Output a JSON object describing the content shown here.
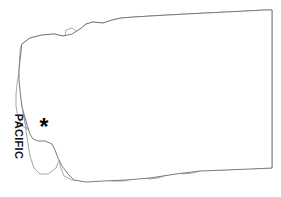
{
  "figure": {
    "subject_state": "Washington",
    "background_color": "#ffffff",
    "county_line_color": "#8a8a8a",
    "state_outline_color": "#6e6e6e",
    "marker_color": "#000000"
  },
  "labels": {
    "ocean_label": "PACIFIC",
    "ocean_label_orientation": "vertical-rotated-90",
    "marker_glyph": "*",
    "marker_name": "asterisk-marker",
    "marker_meaning": "highlighted county location"
  },
  "geometry": {
    "state_outline": "M 22 44 L 30 38 L 42 35 L 54 34 L 63 36 L 72 34 L 80 29 L 86 24 L 93 22 L 103 23 L 112 20 L 121 18 L 134 17 L 150 16 L 168 15 L 186 14 L 206 13 L 226 12 L 246 11 L 264 10 L 272 10 L 272 30 L 272 60 L 272 90 L 272 120 L 272 150 L 272 168 L 250 169 L 226 170 L 200 171 L 176 174 L 150 178 L 126 180 L 104 181 L 86 182 L 74 180 L 68 174 L 62 166 L 58 158 L 55 150 L 52 144 L 45 141 L 38 141 L 33 139 L 30 134 L 28 128 L 26 121 L 24 114 L 22 107 L 21 99 L 20 90 L 19 80 L 19 70 L 20 60 L 21 52 Z",
    "counties": [
      "M 22 44 L 30 38 L 42 35 L 54 34 L 63 36 L 72 34 L 80 29 L 86 24 L 93 22 L 96 30 L 93 40 L 88 48 L 80 54 L 70 58 L 58 60 L 44 61 L 32 61 L 24 60 L 20 56 L 20 50 Z",
      "M 93 22 L 103 23 L 112 20 L 121 18 L 134 17 L 150 16 L 150 26 L 148 36 L 144 46 L 136 50 L 124 52 L 112 53 L 100 54 L 90 54 L 88 48 L 93 40 L 96 30 Z",
      "M 150 16 L 168 15 L 186 14 L 206 13 L 208 30 L 208 48 L 206 62 L 198 66 L 186 66 L 174 62 L 164 56 L 156 50 L 150 44 L 148 36 Z",
      "M 206 13 L 226 12 L 246 11 L 248 30 L 248 48 L 246 62 L 240 68 L 228 70 L 216 68 L 208 64 L 206 62 L 208 48 L 208 30 Z",
      "M 246 11 L 264 10 L 272 10 L 272 30 L 272 56 L 272 74 L 260 74 L 250 72 L 246 68 L 246 62 L 248 48 L 248 30 Z",
      "M 20 56 L 32 61 L 44 61 L 58 60 L 70 58 L 80 54 L 82 66 L 82 78 L 80 88 L 72 92 L 58 94 L 44 94 L 30 94 L 22 92 L 20 86 L 19 74 Z",
      "M 80 54 L 90 54 L 100 54 L 112 53 L 124 52 L 126 66 L 126 80 L 124 92 L 116 96 L 104 98 L 92 98 L 84 96 L 80 88 L 82 78 L 82 66 Z",
      "M 124 52 L 136 50 L 144 46 L 148 36 L 150 44 L 156 50 L 164 56 L 166 70 L 164 84 L 158 94 L 148 98 L 136 98 L 128 96 L 124 92 L 126 80 L 126 66 Z",
      "M 166 70 L 174 62 L 186 66 L 198 66 L 206 62 L 208 64 L 206 76 L 200 86 L 192 94 L 182 98 L 172 100 L 164 98 L 158 94 L 164 84 Z",
      "M 206 62 L 216 68 L 228 70 L 240 68 L 246 68 L 250 72 L 250 86 L 248 100 L 240 104 L 226 106 L 212 106 L 204 102 L 202 94 L 206 76 Z",
      "M 250 72 L 260 74 L 272 74 L 272 96 L 272 112 L 262 114 L 252 112 L 248 106 L 248 100 L 250 86 Z",
      "M 20 86 L 22 92 L 30 94 L 44 94 L 58 94 L 60 106 L 58 118 L 52 126 L 42 130 L 32 132 L 26 128 L 24 118 L 22 106 L 21 96 Z",
      "M 58 94 L 72 92 L 80 88 L 84 96 L 92 98 L 94 110 L 94 124 L 90 134 L 80 138 L 68 138 L 60 134 L 58 124 L 58 112 Z",
      "M 92 98 L 104 98 L 116 96 L 124 92 L 128 96 L 136 98 L 138 112 L 136 126 L 130 136 L 120 140 L 108 140 L 98 138 L 94 132 L 94 116 Z",
      "M 136 98 L 148 98 L 158 94 L 164 98 L 172 100 L 174 114 L 172 128 L 166 138 L 156 142 L 144 142 L 138 138 L 136 126 L 138 112 Z",
      "M 172 100 L 182 98 L 192 94 L 200 86 L 206 76 L 202 94 L 204 102 L 206 114 L 204 126 L 196 134 L 186 138 L 176 138 L 174 128 Z",
      "M 204 102 L 212 106 L 226 106 L 240 104 L 248 100 L 248 106 L 252 112 L 252 124 L 248 134 L 236 138 L 222 138 L 210 136 L 206 128 L 206 114 Z",
      "M 252 112 L 262 114 L 272 112 L 272 134 L 272 146 L 262 148 L 252 146 L 248 140 L 248 134 L 252 124 Z",
      "M 26 128 L 32 132 L 42 130 L 52 126 L 58 118 L 58 124 L 60 134 L 62 146 L 60 158 L 56 168 L 48 174 L 40 174 L 34 168 L 30 156 L 28 144 Z",
      "M 60 134 L 68 138 L 80 138 L 90 134 L 94 132 L 98 138 L 100 152 L 98 166 L 92 176 L 82 180 L 72 180 L 64 176 L 60 166 L 60 150 Z",
      "M 98 138 L 108 140 L 120 140 L 130 136 L 136 126 L 138 138 L 144 142 L 146 156 L 144 170 L 136 178 L 124 181 L 112 181 L 102 178 L 98 170 L 98 154 Z",
      "M 138 138 L 144 142 L 156 142 L 166 138 L 172 128 L 174 128 L 176 138 L 180 152 L 178 166 L 170 174 L 158 178 L 148 179 L 144 170 L 146 156 Z",
      "M 176 138 L 186 138 L 196 134 L 204 126 L 206 128 L 210 136 L 214 150 L 212 164 L 204 170 L 192 173 L 182 174 L 178 166 L 180 152 Z",
      "M 210 136 L 222 138 L 236 138 L 248 134 L 248 140 L 252 146 L 252 158 L 248 166 L 236 169 L 224 170 L 214 170 L 212 164 L 214 150 Z",
      "M 252 146 L 262 148 L 272 146 L 272 160 L 272 168 L 262 168 L 252 169 L 248 166 L 252 158 Z",
      "M 19 74 L 20 86 L 21 96 L 22 106 L 24 118 L 26 128 L 22 126 L 18 118 L 16 106 L 16 94 L 17 84 Z"
    ],
    "islands": [
      "M 66 30 L 72 28 L 76 31 L 75 36 L 70 38 L 65 36 Z",
      "M 56 38 L 62 37 L 64 41 L 61 45 L 56 44 Z",
      "M 78 40 L 83 39 L 85 43 L 81 46 L 77 44 Z",
      "M 62 48 L 67 47 L 69 51 L 65 54 L 61 52 Z",
      "M 72 56 L 78 55 L 80 61 L 76 65 L 71 62 Z",
      "M 82 62 L 86 60 L 89 65 L 86 70 L 82 68 Z",
      "M 74 70 L 79 70 L 81 76 L 77 80 L 73 77 Z",
      "M 84 76 L 88 75 L 90 80 L 87 84 L 83 82 Z",
      "M 68 82 L 73 82 L 75 88 L 71 92 L 67 88 Z",
      "M 80 88 L 85 88 L 87 94 L 83 98 L 79 95 Z",
      "M 72 96 L 77 96 L 79 102 L 75 106 L 71 102 Z",
      "M 84 100 L 88 100 L 90 105 L 86 109 L 83 106 Z"
    ]
  }
}
